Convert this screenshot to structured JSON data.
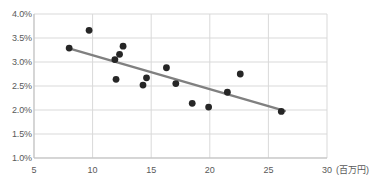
{
  "chart_data": {
    "type": "scatter",
    "title": "",
    "subtitle": "",
    "xlabel": "(百万円)",
    "ylabel": "",
    "xlim": [
      5,
      30
    ],
    "ylim": [
      1.0,
      4.0
    ],
    "grid": true,
    "legend": false,
    "legend_position": "none",
    "x_ticks": [
      5,
      10,
      15,
      20,
      25,
      30
    ],
    "x_tick_labels": [
      "5",
      "10",
      "15",
      "20",
      "25",
      "30"
    ],
    "y_ticks": [
      1.0,
      1.5,
      2.0,
      2.5,
      3.0,
      3.5,
      4.0
    ],
    "y_tick_labels": [
      "1.0%",
      "1.5%",
      "2.0%",
      "2.5%",
      "3.0%",
      "3.5%",
      "4.0%"
    ],
    "x_unit_suffix": "(百万円)",
    "marker_color": "#262626",
    "trendline_color": "#808080",
    "grid_color": "#d9d9d9",
    "axis_color": "#bfbfbf",
    "tick_text_color": "#595959",
    "points": [
      {
        "x": 8.0,
        "y": 3.29
      },
      {
        "x": 9.7,
        "y": 3.66
      },
      {
        "x": 11.9,
        "y": 3.05
      },
      {
        "x": 12.0,
        "y": 2.64
      },
      {
        "x": 12.3,
        "y": 3.16
      },
      {
        "x": 12.6,
        "y": 3.33
      },
      {
        "x": 14.3,
        "y": 2.52
      },
      {
        "x": 14.6,
        "y": 2.67
      },
      {
        "x": 16.3,
        "y": 2.88
      },
      {
        "x": 17.1,
        "y": 2.55
      },
      {
        "x": 18.5,
        "y": 2.14
      },
      {
        "x": 19.9,
        "y": 2.06
      },
      {
        "x": 21.5,
        "y": 2.37
      },
      {
        "x": 22.6,
        "y": 2.75
      },
      {
        "x": 26.1,
        "y": 1.97
      }
    ],
    "trendline": {
      "x_start": 8.2,
      "y_start": 3.27,
      "x_end": 26.4,
      "y_end": 1.98
    }
  }
}
